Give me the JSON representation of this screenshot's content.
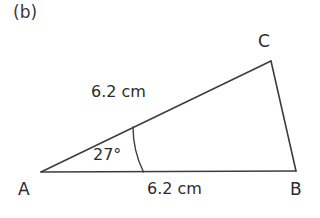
{
  "figure": {
    "part_label": "(b)",
    "shape": "triangle",
    "background_color": "#ffffff",
    "stroke_color": "#3c3c46",
    "text_color": "#2b2b2b",
    "vertices": [
      {
        "name": "A",
        "label": "A",
        "x": 41,
        "y": 172
      },
      {
        "name": "B",
        "label": "B",
        "x": 296,
        "y": 171
      },
      {
        "name": "C",
        "label": "C",
        "x": 271,
        "y": 61
      }
    ],
    "edges": [
      {
        "name": "side-ab",
        "from": "A",
        "to": "B",
        "label": "6.2 cm"
      },
      {
        "name": "side-ac",
        "from": "A",
        "to": "C",
        "label": "6.2 cm"
      },
      {
        "name": "side-cb",
        "from": "C",
        "to": "B",
        "label": ""
      }
    ],
    "angles": [
      {
        "name": "angle-a",
        "at": "A",
        "label": "27°",
        "value": 27,
        "unit": "degrees"
      }
    ],
    "labels": {
      "side_ac_length": "6.2 cm",
      "side_ab_length": "6.2 cm",
      "angle_a": "27°"
    }
  }
}
